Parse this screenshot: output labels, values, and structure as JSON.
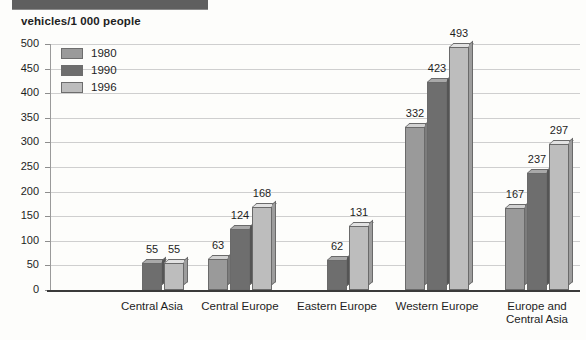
{
  "header": {
    "axis_title": "vehicles/1 000 people"
  },
  "legend": {
    "items": [
      {
        "label": "1980",
        "swatch": "#9a9a9a"
      },
      {
        "label": "1990",
        "swatch": "#6e6e6e"
      },
      {
        "label": "1996",
        "swatch": "#bdbdbd"
      }
    ]
  },
  "y_ticks": [
    "500",
    "450",
    "400",
    "350",
    "300",
    "250",
    "200",
    "150",
    "100",
    "50",
    "0"
  ],
  "categories": [
    {
      "line1": "Central Asia",
      "line2": ""
    },
    {
      "line1": "Central Europe",
      "line2": ""
    },
    {
      "line1": "Eastern Europe",
      "line2": ""
    },
    {
      "line1": "Western Europe",
      "line2": ""
    },
    {
      "line1": "Europe and",
      "line2": "Central Asia"
    }
  ],
  "chart_data": {
    "type": "bar",
    "title": "vehicles/1 000 people",
    "xlabel": "",
    "ylabel": "vehicles/1 000 people",
    "ylim": [
      0,
      500
    ],
    "ytick_step": 50,
    "grid": true,
    "legend_position": "top-left inside plot",
    "categories": [
      "Central Asia",
      "Central Europe",
      "Eastern Europe",
      "Western Europe",
      "Europe and Central Asia"
    ],
    "series": [
      {
        "name": "1980",
        "color": "#9a9a9a",
        "values": [
          null,
          63,
          null,
          332,
          167
        ]
      },
      {
        "name": "1990",
        "color": "#6e6e6e",
        "values": [
          55,
          124,
          62,
          423,
          237
        ]
      },
      {
        "name": "1996",
        "color": "#bdbdbd",
        "values": [
          55,
          168,
          131,
          493,
          297
        ]
      }
    ],
    "data_labels": {
      "Central Asia": {
        "1980": null,
        "1990": "55",
        "1996": "55"
      },
      "Central Europe": {
        "1980": "63",
        "1990": "124",
        "1996": "168"
      },
      "Eastern Europe": {
        "1980": null,
        "1990": "62",
        "1996": "131"
      },
      "Western Europe": {
        "1980": "332",
        "1990": "423",
        "1996": "493"
      },
      "Europe and Central Asia": {
        "1980": "167",
        "1990": "237",
        "1996": "297"
      }
    }
  }
}
